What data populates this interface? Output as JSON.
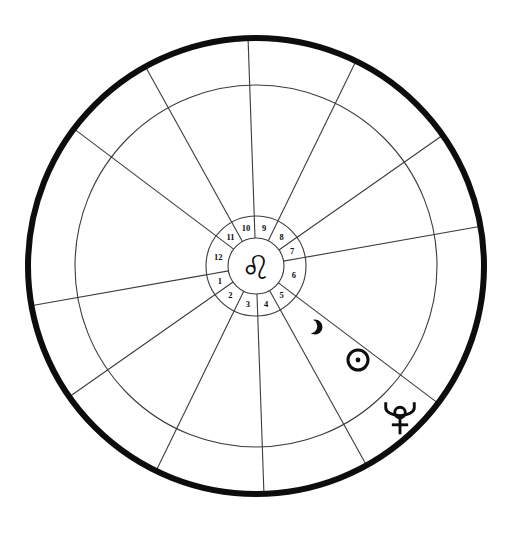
{
  "chart": {
    "background_color": "#ffffff",
    "ink_color": "#0d0d0d",
    "thin_line_color": "#3c3c3c",
    "center": {
      "x": 256,
      "y": 266
    },
    "rings": {
      "outer_rim_radius": 228,
      "outer_rim_stroke_width": 6,
      "middle_circle_radius": 181,
      "middle_circle_stroke_width": 1.1,
      "house_ring_outer_radius": 50,
      "house_ring_inner_radius": 28,
      "house_ring_stroke_width": 1.1
    },
    "center_sign": {
      "name": "leo",
      "glyph": "♌",
      "label": "Leo"
    },
    "house_cusp_angles_deg": [
      190,
      215,
      244,
      272,
      299,
      323,
      10,
      35,
      64,
      92,
      119,
      143
    ],
    "houses": [
      {
        "number": "1",
        "label_angle_deg": 202
      },
      {
        "number": "2",
        "label_angle_deg": 229
      },
      {
        "number": "3",
        "label_angle_deg": 258
      },
      {
        "number": "4",
        "label_angle_deg": 285
      },
      {
        "number": "5",
        "label_angle_deg": 311
      },
      {
        "number": "6",
        "label_angle_deg": 346
      },
      {
        "number": "7",
        "label_angle_deg": 22
      },
      {
        "number": "8",
        "label_angle_deg": 49
      },
      {
        "number": "9",
        "label_angle_deg": 78
      },
      {
        "number": "10",
        "label_angle_deg": 105
      },
      {
        "number": "11",
        "label_angle_deg": 131
      },
      {
        "number": "12",
        "label_angle_deg": 166
      }
    ],
    "planets": [
      {
        "name": "moon",
        "label": "Moon",
        "glyph": "☽",
        "x": 315,
        "y": 327,
        "size": 15
      },
      {
        "name": "sun",
        "label": "Sun",
        "glyph": "☉",
        "x": 358,
        "y": 360,
        "size": 24
      },
      {
        "name": "pluto",
        "label": "Pluto",
        "glyph": "♇",
        "x": 400,
        "y": 418,
        "size": 34
      }
    ]
  }
}
